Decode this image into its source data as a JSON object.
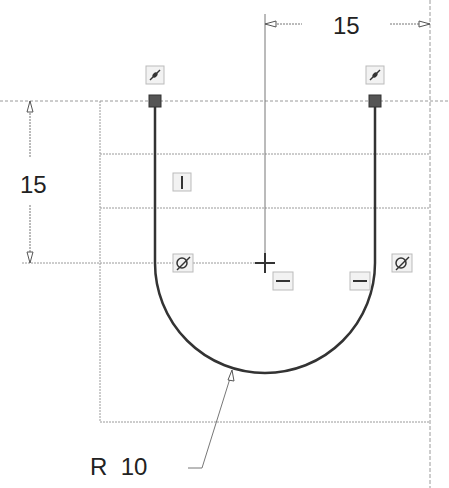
{
  "sketch": {
    "dimensions": {
      "horizontal": {
        "value": "15",
        "label": "15"
      },
      "vertical": {
        "value": "15",
        "label": "15"
      },
      "radius": {
        "value": "10",
        "label": "R  10"
      }
    },
    "constraints": [
      {
        "type": "coincident",
        "icon": "coincident-icon"
      },
      {
        "type": "vertical",
        "icon": "vertical-icon"
      },
      {
        "type": "tangent",
        "icon": "tangent-icon"
      },
      {
        "type": "horizontal",
        "icon": "horizontal-icon"
      }
    ],
    "colors": {
      "geometry": "#333333",
      "construction": "#999999",
      "dimension": "#777777",
      "endpoint": "#444444"
    }
  }
}
